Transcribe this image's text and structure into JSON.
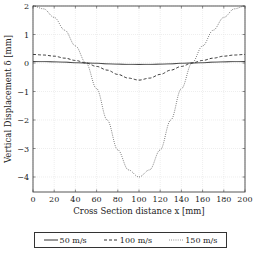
{
  "chart_data": {
    "type": "line",
    "title": "",
    "xlabel": "Cross Section distance x [mm]",
    "ylabel": "Vertical Displacement δ [mm]",
    "xlim": [
      0,
      200
    ],
    "ylim": [
      -4.5,
      2
    ],
    "xticks": [
      0,
      20,
      40,
      60,
      80,
      100,
      120,
      140,
      160,
      180,
      200
    ],
    "yticks": [
      -4,
      -3,
      -2,
      -1,
      0,
      1,
      2
    ],
    "grid": true,
    "legend_position": "below",
    "x": [
      0,
      10,
      20,
      30,
      40,
      50,
      60,
      70,
      80,
      90,
      100,
      110,
      120,
      130,
      140,
      150,
      160,
      170,
      180,
      190,
      200
    ],
    "series": [
      {
        "name": "50 m/s",
        "style": "solid",
        "values": [
          0.05,
          0.05,
          0.04,
          0.03,
          0.01,
          0.0,
          -0.01,
          -0.03,
          -0.04,
          -0.05,
          -0.05,
          -0.05,
          -0.04,
          -0.03,
          -0.01,
          0.0,
          0.01,
          0.03,
          0.04,
          0.05,
          0.05
        ]
      },
      {
        "name": "100 m/s",
        "style": "dashed",
        "values": [
          0.3,
          0.28,
          0.24,
          0.17,
          0.09,
          0.0,
          -0.12,
          -0.25,
          -0.4,
          -0.53,
          -0.6,
          -0.53,
          -0.4,
          -0.25,
          -0.12,
          0.0,
          0.09,
          0.17,
          0.24,
          0.28,
          0.3
        ]
      },
      {
        "name": "150 m/s",
        "style": "dotted",
        "values": [
          2.0,
          1.9,
          1.6,
          1.15,
          0.6,
          0.0,
          -0.9,
          -2.0,
          -3.05,
          -3.75,
          -4.0,
          -3.75,
          -3.05,
          -2.0,
          -0.9,
          0.0,
          0.6,
          1.15,
          1.6,
          1.9,
          2.0
        ]
      }
    ]
  },
  "axes": {
    "xlabel": "Cross Section distance x [mm]",
    "ylabel": "Vertical Displacement δ [mm]"
  },
  "legend": [
    {
      "label": "50 m/s",
      "style": "solid"
    },
    {
      "label": "100 m/s",
      "style": "dashed"
    },
    {
      "label": "150 m/s",
      "style": "dotted"
    }
  ],
  "colors": {
    "line": "#333333",
    "grid": "#e2e2e2",
    "frame": "#444444"
  }
}
